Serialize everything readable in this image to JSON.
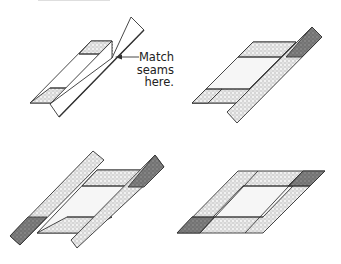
{
  "page": {
    "clipped_header_text": "",
    "callout": {
      "lines": [
        "Match",
        "seams",
        "here."
      ]
    }
  },
  "figures": [
    {
      "id": "step-1",
      "description": "Panel with one border strip folded over, seams matched"
    },
    {
      "id": "step-2",
      "description": "Border strip sewn on right side"
    },
    {
      "id": "step-3",
      "description": "Border strips on both sides"
    },
    {
      "id": "step-4",
      "description": "Completed framed block"
    }
  ],
  "colors": {
    "outline": "#333333",
    "light_fabric": "#d9d9d9",
    "dark_fabric": "#7a7a7a",
    "white_fabric": "#ffffff",
    "center": "#f4f4f4"
  }
}
